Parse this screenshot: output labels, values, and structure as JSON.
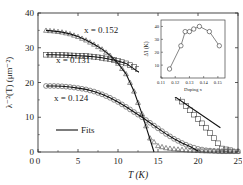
{
  "chart_data": [
    {
      "type": "scatter",
      "title": "",
      "xlabel": "T (K)",
      "ylabel": "λ⁻²(T) (μm⁻²)",
      "xlim": [
        0,
        25
      ],
      "ylim": [
        0,
        40
      ],
      "xticks": [
        0,
        5,
        10,
        15,
        20,
        25
      ],
      "yticks": [
        10,
        20,
        30,
        40
      ],
      "grid": false,
      "legend": {
        "position": "lower-left",
        "entries": [
          "Fits"
        ]
      },
      "annotations": [
        "x = 0.152",
        "x = 0.131",
        "x = 0.124"
      ],
      "series": [
        {
          "name": "x = 0.152",
          "marker": "triangle",
          "x": [
            1,
            2,
            3,
            4,
            5,
            6,
            7,
            8,
            9,
            10,
            11,
            12,
            13,
            14,
            15,
            16,
            17,
            18,
            19,
            20,
            21,
            22,
            23,
            24,
            25
          ],
          "y": [
            35,
            34.8,
            34.5,
            34,
            33.2,
            32.2,
            31,
            29.6,
            27.8,
            25.5,
            22.5,
            17.5,
            11,
            4,
            1.8,
            1.2,
            0.9,
            0.7,
            0.5,
            0.4,
            0.3,
            0.3,
            0.2,
            0.2,
            0.2
          ]
        },
        {
          "name": "x = 0.131",
          "marker": "square",
          "x": [
            1,
            2,
            3,
            4,
            5,
            6,
            7,
            8,
            9,
            10,
            11,
            12,
            13,
            14,
            15,
            16,
            17,
            18,
            19,
            20,
            21,
            22,
            23,
            24
          ],
          "y": [
            28,
            28,
            27.9,
            27.8,
            27.7,
            27.6,
            27.4,
            27.1,
            26.7,
            26.2,
            25.5,
            24.5,
            23.2,
            21.8,
            20.3,
            18.7,
            16.8,
            14.5,
            12,
            9.5,
            7,
            4,
            1,
            0.5
          ]
        },
        {
          "name": "x = 0.124",
          "marker": "circle",
          "x": [
            1,
            2,
            3,
            4,
            5,
            6,
            7,
            8,
            9,
            10,
            11,
            12,
            13,
            14,
            15,
            16,
            17,
            18,
            19,
            20,
            21,
            22,
            23,
            24,
            25
          ],
          "y": [
            19,
            19,
            18.9,
            18.7,
            18.4,
            18,
            17.4,
            16.6,
            15.6,
            14.4,
            13,
            11.5,
            10,
            8.4,
            6.8,
            5.2,
            3.8,
            2.6,
            1.6,
            0.9,
            0.5,
            0.3,
            0.2,
            0.2,
            0.2
          ]
        }
      ]
    },
    {
      "type": "line",
      "inset": true,
      "xlabel": "Doping x",
      "ylabel": "Δ'_l (K)",
      "xlim": [
        0.11,
        0.155
      ],
      "ylim": [
        0,
        45
      ],
      "xticks": [
        0.11,
        0.12,
        0.13,
        0.14,
        0.15
      ],
      "yticks": [
        0,
        10,
        20,
        30,
        40
      ],
      "series": [
        {
          "name": "gap",
          "marker": "circle",
          "x": [
            0.116,
            0.124,
            0.127,
            0.13,
            0.133,
            0.137,
            0.144,
            0.151
          ],
          "y": [
            7,
            25,
            36,
            36,
            38,
            40,
            36,
            25
          ]
        }
      ]
    }
  ],
  "labels": {
    "series_152": "x = 0.152",
    "series_131": "x = 0.131",
    "series_124": "x = 0.124",
    "legend_fits": "Fits",
    "xlabel": "T (K)",
    "ylabel": "λ⁻²(T) (μm⁻²)",
    "inset_xlabel": "Doping x",
    "inset_ylabel": "Δ'l (K)"
  }
}
